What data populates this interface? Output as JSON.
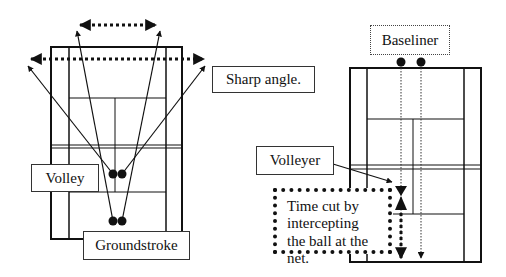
{
  "diagram": {
    "left_panel": {
      "labels": {
        "sharp_angle": "Sharp angle.",
        "volley": "Volley",
        "groundstroke": "Groundstroke"
      }
    },
    "right_panel": {
      "labels": {
        "baseliner": "Baseliner",
        "volleyer": "Volleyer",
        "time_cut": "Time cut by intercepting the ball at the net."
      }
    },
    "colors": {
      "line": "#111111",
      "background": "#ffffff"
    }
  }
}
